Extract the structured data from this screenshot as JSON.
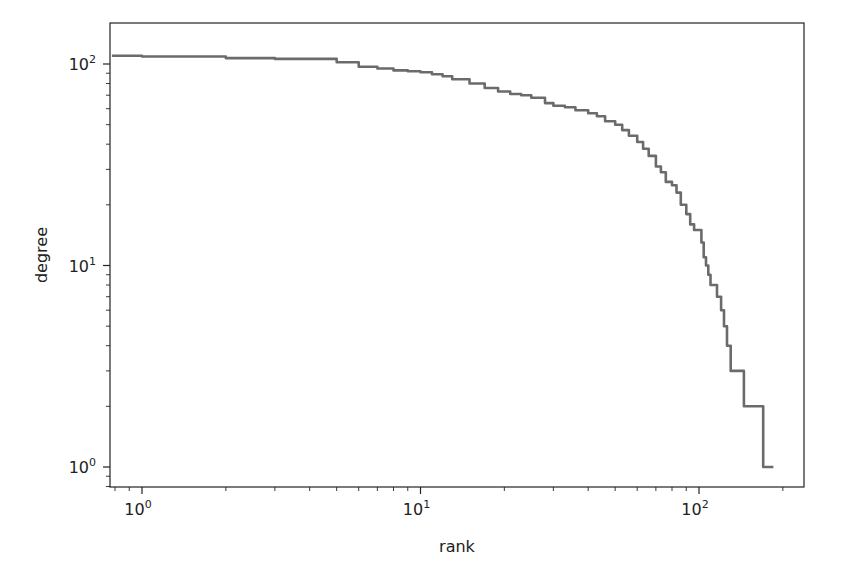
{
  "chart_data": {
    "type": "line",
    "title": "",
    "xlabel": "rank",
    "ylabel": "degree",
    "xscale": "log",
    "yscale": "log",
    "xlim": [
      0.77,
      230
    ],
    "ylim": [
      0.8,
      160
    ],
    "grid": false,
    "legend": null,
    "line_color": "#6b6b6b",
    "x_ticks": [
      {
        "value": 1,
        "label": "10",
        "exp": "0"
      },
      {
        "value": 10,
        "label": "10",
        "exp": "1"
      },
      {
        "value": 100,
        "label": "10",
        "exp": "2"
      }
    ],
    "y_ticks": [
      {
        "value": 1,
        "label": "10",
        "exp": "0"
      },
      {
        "value": 10,
        "label": "10",
        "exp": "1"
      },
      {
        "value": 100,
        "label": "10",
        "exp": "2"
      }
    ],
    "series": [
      {
        "name": "degree-rank",
        "step": true,
        "x": [
          0.78,
          1,
          2,
          3,
          4,
          5,
          6,
          7,
          8,
          9,
          10,
          11,
          12,
          13,
          15,
          17,
          19,
          21,
          23,
          25,
          28,
          30,
          33,
          36,
          40,
          43,
          46,
          50,
          53,
          56,
          60,
          63,
          66,
          70,
          73,
          76,
          80,
          83,
          86,
          90,
          93,
          96,
          100,
          102,
          104,
          106,
          108,
          110,
          113,
          116,
          120,
          123,
          126,
          130,
          135,
          140,
          145,
          150,
          160,
          168,
          170,
          185
        ],
        "y": [
          110,
          109,
          107,
          106,
          106,
          102,
          97,
          95,
          93,
          92,
          91,
          89,
          87,
          84,
          80,
          76,
          73,
          71,
          70,
          68,
          64,
          62,
          61,
          59,
          57,
          55,
          52,
          50,
          47,
          44,
          41,
          38,
          35,
          31,
          29,
          26,
          25,
          23,
          20,
          18,
          16,
          15,
          15,
          13,
          11,
          10,
          9,
          8,
          8,
          7,
          6,
          5,
          4,
          3,
          3,
          3,
          2,
          2,
          2,
          2,
          1,
          1
        ]
      }
    ]
  },
  "labels": {
    "xlabel": "rank",
    "ylabel": "degree"
  }
}
